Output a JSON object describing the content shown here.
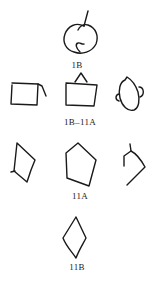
{
  "figure": {
    "labels": {
      "top": "1B",
      "middle": "1B–11A",
      "lower": "11A",
      "bottom": "11B"
    },
    "colors": {
      "stroke": "#1a1a1a",
      "background": "#ffffff",
      "text": "#222222"
    },
    "shapes": [
      {
        "id": "1B-loop",
        "row": 1,
        "description": "looped circular glyph with stem"
      },
      {
        "id": "open-rectangle-left",
        "row": 2,
        "description": "rectangle with open right hook"
      },
      {
        "id": "rectangle-with-triangle",
        "row": 2,
        "description": "rectangle topped with small triangle"
      },
      {
        "id": "head-with-ear",
        "row": 2,
        "description": "rounded head shape with side ear"
      },
      {
        "id": "quadrilateral-left",
        "row": 3,
        "description": "irregular quadrilateral"
      },
      {
        "id": "pentagon",
        "row": 3,
        "description": "irregular pentagon"
      },
      {
        "id": "open-angle-right",
        "row": 3,
        "description": "open angular shape"
      },
      {
        "id": "diamond",
        "row": 4,
        "description": "vertical diamond/rhombus"
      }
    ]
  }
}
